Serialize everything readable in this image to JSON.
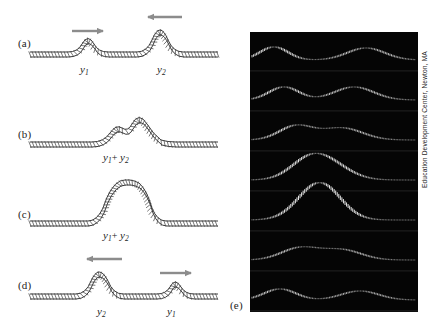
{
  "figure": {
    "panel_labels": [
      "(a)",
      "(b)",
      "(c)",
      "(d)",
      "(e)"
    ],
    "credit": "Education Development Center, Newton, MA",
    "arrow_color": "#8c8c8c",
    "rope_color": "#3a3a3a",
    "photo_background": "#050505",
    "photo_trace_color": "#f2f2f2"
  },
  "panels": [
    {
      "id": "a",
      "label": "(a)",
      "label_x": 18,
      "label_y": 43,
      "baseline_y": 52,
      "description": "Two separate pulses approaching each other",
      "pulses": [
        {
          "name": "y1",
          "label": "y",
          "sub": "1",
          "center_x": 88,
          "height": 16,
          "width": 40,
          "label_x": 80,
          "label_y": 62,
          "arrow": {
            "direction": "right",
            "x": 72,
            "y": 31,
            "length": 34
          }
        },
        {
          "name": "y2",
          "label": "y",
          "sub": "2",
          "center_x": 165,
          "height": 30,
          "width": 56,
          "label_x": 157,
          "label_y": 62,
          "arrow": {
            "direction": "left",
            "x": 144,
            "y": 17,
            "length": 38
          }
        }
      ]
    },
    {
      "id": "b",
      "label": "(b)",
      "label_x": 18,
      "label_y": 135,
      "baseline_y": 142,
      "description": "Pulses partially overlapping",
      "sum_label": {
        "label": "y",
        "sub1": "1",
        "plus": "+",
        "sub2": "2",
        "text": "y1+ y2",
        "x": 103,
        "y": 156
      },
      "pulses": [
        {
          "name": "y1",
          "center_x": 117,
          "height": 14,
          "width": 44
        },
        {
          "name": "y2",
          "center_x": 143,
          "height": 27,
          "width": 52
        }
      ]
    },
    {
      "id": "c",
      "label": "(c)",
      "label_x": 18,
      "label_y": 215,
      "baseline_y": 221,
      "description": "Pulses fully overlapping, maximum constructive interference",
      "sum_label": {
        "text": "y1+ y2",
        "label": "y",
        "sub1": "1",
        "plus": "+",
        "sub2": "2",
        "x": 103,
        "y": 234
      },
      "pulses": [
        {
          "name": "y1+y2",
          "center_x": 124,
          "height": 43,
          "width": 62
        }
      ]
    },
    {
      "id": "d",
      "label": "(d)",
      "label_x": 18,
      "label_y": 285,
      "baseline_y": 294,
      "description": "Pulses have passed through each other and separated",
      "pulses": [
        {
          "name": "y2",
          "label": "y",
          "sub": "2",
          "center_x": 105,
          "height": 29,
          "width": 54,
          "label_x": 97,
          "label_y": 305,
          "arrow": {
            "direction": "left",
            "x": 85,
            "y": 259,
            "length": 38
          }
        },
        {
          "name": "y1",
          "label": "y",
          "sub": "1",
          "center_x": 175,
          "height": 15,
          "width": 40,
          "label_x": 167,
          "label_y": 305,
          "arrow": {
            "direction": "right",
            "x": 160,
            "y": 273,
            "length": 34
          }
        }
      ]
    },
    {
      "id": "e",
      "label": "(e)",
      "label_x": 230,
      "label_y": 306,
      "description": "Strobe photograph showing seven successive frames of two pulses meeting and passing on a real rope",
      "frame_count": 7,
      "frames": [
        {
          "index": 1,
          "description": "two separate pulses approaching"
        },
        {
          "index": 2,
          "description": "pulses closer together"
        },
        {
          "index": 3,
          "description": "pulses beginning to overlap"
        },
        {
          "index": 4,
          "description": "pulses overlapping, amplitude growing"
        },
        {
          "index": 5,
          "description": "maximum constructive interference, single tall pulse"
        },
        {
          "index": 6,
          "description": "pulses separating again"
        },
        {
          "index": 7,
          "description": "pulses fully separated, travelling apart"
        }
      ]
    }
  ]
}
